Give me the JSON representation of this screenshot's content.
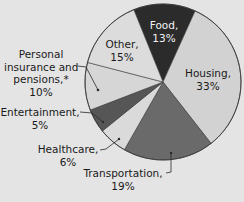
{
  "chart_data": {
    "type": "pie",
    "title": "",
    "start_angle_deg": -22,
    "direction": "clockwise",
    "slices": [
      {
        "label": "Food",
        "value": 13,
        "color": "#2b2b2b"
      },
      {
        "label": "Housing",
        "value": 33,
        "color": "#d2d2d2"
      },
      {
        "label": "Transportation",
        "value": 19,
        "color": "#6a6a6a"
      },
      {
        "label": "Healthcare",
        "value": 6,
        "color": "#dadada"
      },
      {
        "label": "Entertainment",
        "value": 5,
        "color": "#565656"
      },
      {
        "label": "Personal insurance and pensions,*",
        "value": 10,
        "color": "#d6d6d6"
      },
      {
        "label": "Other",
        "value": 15,
        "color": "#dcdcdc"
      }
    ],
    "units": "%"
  },
  "labels": {
    "food": {
      "name": "Food,",
      "pct": "13%"
    },
    "housing": {
      "name": "Housing,",
      "pct": "33%"
    },
    "transportation": {
      "name": "Transportation,",
      "pct": "19%"
    },
    "healthcare": {
      "name": "Healthcare,",
      "pct": "6%"
    },
    "entertainment": {
      "name": "Entertainment,",
      "pct": "5%"
    },
    "insurance": {
      "line1": "Personal",
      "line2": "insurance and",
      "line3": "pensions,*",
      "pct": "10%"
    },
    "other": {
      "name": "Other,",
      "pct": "15%"
    }
  },
  "colors": {
    "background": "#e4e4e4",
    "outline": "#3a3a3a"
  }
}
